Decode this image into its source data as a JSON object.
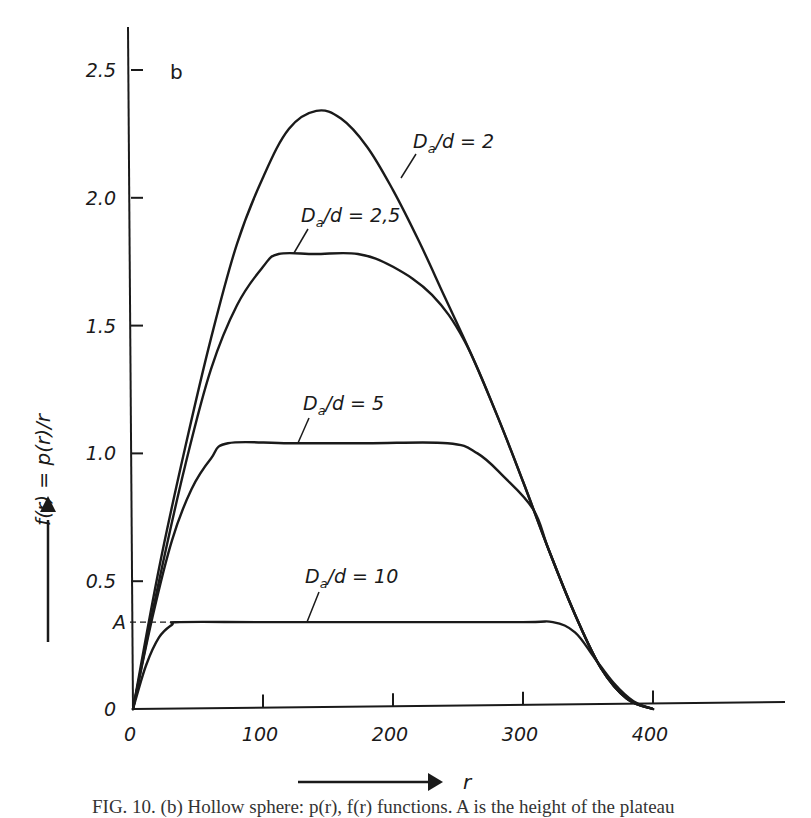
{
  "chart_data": {
    "type": "line",
    "panel_label": "b",
    "title": "",
    "xlabel": "r",
    "ylabel": "f(r) = p(r)/r",
    "xlim": [
      0,
      500
    ],
    "ylim": [
      0,
      2.6
    ],
    "grid": false,
    "x_ticks": [
      0,
      100,
      200,
      300,
      400
    ],
    "x_tick_labels": [
      "0",
      "100",
      "200",
      "300",
      "400"
    ],
    "y_ticks": [
      0,
      0.5,
      1.0,
      1.5,
      2.0,
      2.5
    ],
    "y_tick_labels": [
      "0",
      "0.5",
      "1.0",
      "1.5",
      "2.0",
      "2.5"
    ],
    "annotations": [
      {
        "text": "A",
        "y": 0.34,
        "note": "dashed line marks plateau height of Da/d = 10 curve"
      }
    ],
    "series": [
      {
        "name": "Da/d = 2",
        "label": "D",
        "label_sub": "a",
        "label_rest": "/d = 2",
        "x": [
          0,
          20,
          40,
          60,
          80,
          100,
          120,
          141,
          160,
          180,
          200,
          220,
          240,
          260,
          280,
          300,
          320,
          340,
          360,
          380,
          400
        ],
        "y": [
          0,
          0.55,
          1.02,
          1.45,
          1.82,
          2.08,
          2.27,
          2.34,
          2.31,
          2.2,
          2.03,
          1.83,
          1.61,
          1.39,
          1.15,
          0.89,
          0.62,
          0.37,
          0.16,
          0.04,
          0
        ]
      },
      {
        "name": "Da/d = 2,5",
        "label": "D",
        "label_sub": "a",
        "label_rest": "/d = 2,5",
        "x": [
          0,
          20,
          40,
          60,
          80,
          100,
          112,
          140,
          173,
          200,
          230,
          255,
          280,
          300,
          320,
          340,
          360,
          380,
          400
        ],
        "y": [
          0,
          0.5,
          0.95,
          1.33,
          1.58,
          1.73,
          1.78,
          1.78,
          1.78,
          1.73,
          1.62,
          1.44,
          1.15,
          0.89,
          0.62,
          0.37,
          0.16,
          0.04,
          0
        ]
      },
      {
        "name": "Da/d = 5",
        "label": "D",
        "label_sub": "a",
        "label_rest": "/d = 5",
        "x": [
          0,
          15,
          30,
          45,
          60,
          73,
          120,
          180,
          242,
          265,
          285,
          308,
          320,
          340,
          360,
          380,
          400
        ],
        "y": [
          0,
          0.36,
          0.66,
          0.86,
          0.98,
          1.04,
          1.04,
          1.04,
          1.04,
          1.0,
          0.91,
          0.78,
          0.62,
          0.37,
          0.16,
          0.04,
          0
        ]
      },
      {
        "name": "Da/d = 10",
        "label": "D",
        "label_sub": "a",
        "label_rest": "/d = 10",
        "x": [
          0,
          10,
          20,
          30,
          36,
          100,
          200,
          300,
          323,
          340,
          355,
          370,
          385,
          400
        ],
        "y": [
          0,
          0.17,
          0.28,
          0.33,
          0.34,
          0.34,
          0.34,
          0.34,
          0.34,
          0.3,
          0.2,
          0.1,
          0.03,
          0
        ]
      }
    ]
  },
  "caption": "FIG. 10. (b) Hollow sphere: p(r), f(r) functions. A is the height of the plateau"
}
